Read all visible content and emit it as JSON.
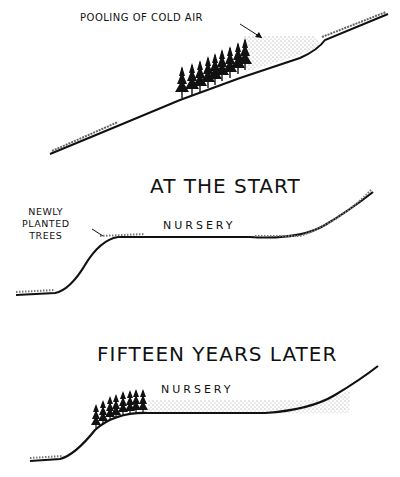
{
  "panels": [
    {
      "id": "slope",
      "annotation": "POOLING OF COLD AIR"
    },
    {
      "id": "start",
      "title": "AT THE START",
      "annotation_lines": [
        "NEWLY",
        "PLANTED",
        "TREES"
      ],
      "area_label": "NURSERY"
    },
    {
      "id": "later",
      "title": "FIFTEEN YEARS LATER",
      "area_label": "NURSERY"
    }
  ],
  "colors": {
    "ink": "#111111",
    "stipple": "#888888",
    "background": "#ffffff"
  }
}
